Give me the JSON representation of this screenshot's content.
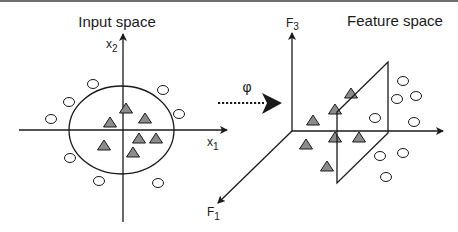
{
  "diagram": {
    "left_panel": {
      "title": "Input space",
      "axis_x_label": "x",
      "axis_x_sub": "1",
      "axis_y_label": "x",
      "axis_y_sub": "2"
    },
    "mapping": {
      "symbol": "φ"
    },
    "right_panel": {
      "title": "Feature space",
      "axis_vertical_label": "F",
      "axis_vertical_sub": "3",
      "axis_depth_label": "F",
      "axis_depth_sub": "1"
    },
    "colors": {
      "line": "#1a1a1a",
      "triangle_fill": "#8c8c8c",
      "circle_fill": "#ffffff",
      "top_band": "#6e6e6e"
    },
    "left_triangles": [
      [
        126,
        108
      ],
      [
        110,
        122
      ],
      [
        145,
        118
      ],
      [
        139,
        138
      ],
      [
        156,
        138
      ],
      [
        104,
        145
      ],
      [
        133,
        152
      ]
    ],
    "left_circles": [
      [
        93,
        84
      ],
      [
        69,
        102
      ],
      [
        51,
        119
      ],
      [
        163,
        90
      ],
      [
        179,
        114
      ],
      [
        70,
        158
      ],
      [
        99,
        181
      ],
      [
        158,
        183
      ]
    ],
    "right_triangles": [
      [
        351,
        93
      ],
      [
        335,
        109
      ],
      [
        313,
        120
      ],
      [
        306,
        144
      ],
      [
        335,
        137
      ],
      [
        359,
        137
      ],
      [
        327,
        166
      ]
    ],
    "right_circles": [
      [
        403,
        81
      ],
      [
        397,
        99
      ],
      [
        416,
        96
      ],
      [
        375,
        118
      ],
      [
        414,
        122
      ],
      [
        380,
        156
      ],
      [
        403,
        153
      ],
      [
        386,
        177
      ]
    ]
  }
}
